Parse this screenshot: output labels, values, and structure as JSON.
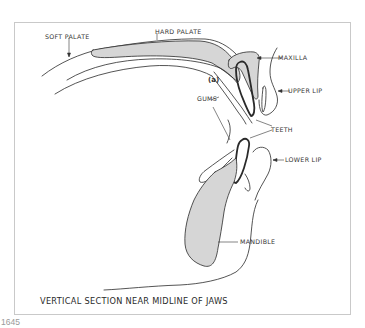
{
  "figure": {
    "number": "1645",
    "caption": "VERTICAL SECTION NEAR MIDLINE OF JAWS"
  },
  "labels": {
    "soft_palate": "SOFT PALATE",
    "hard_palate": "HARD PALATE",
    "maxilla": "MAXILLA",
    "marker_a": "(a)",
    "upper_lip": "UPPER LIP",
    "gums": "GUMS",
    "teeth": "TEETH",
    "lower_lip": "LOWER LIP",
    "mandible": "MANDIBLE"
  },
  "colors": {
    "bone_fill": "#d6d6d6",
    "line": "#2a2a2a",
    "border": "#c9c9c9"
  }
}
